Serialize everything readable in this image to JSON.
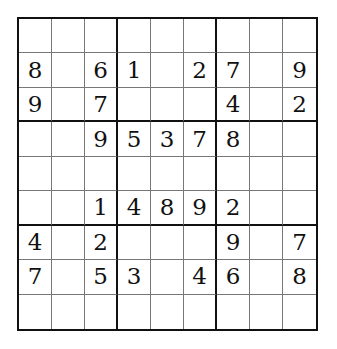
{
  "puzzle": {
    "size": 9,
    "box_size": 3,
    "grid": [
      [
        "",
        "",
        "",
        "",
        "",
        "",
        "",
        "",
        ""
      ],
      [
        "8",
        "",
        "6",
        "1",
        "",
        "2",
        "7",
        "",
        "9"
      ],
      [
        "9",
        "",
        "7",
        "",
        "",
        "",
        "4",
        "",
        "2"
      ],
      [
        "",
        "",
        "9",
        "5",
        "3",
        "7",
        "8",
        "",
        ""
      ],
      [
        "",
        "",
        "",
        "",
        "",
        "",
        "",
        "",
        ""
      ],
      [
        "",
        "",
        "1",
        "4",
        "8",
        "9",
        "2",
        "",
        ""
      ],
      [
        "4",
        "",
        "2",
        "",
        "",
        "",
        "9",
        "",
        "7"
      ],
      [
        "7",
        "",
        "5",
        "3",
        "",
        "4",
        "6",
        "",
        "8"
      ],
      [
        "",
        "",
        "",
        "",
        "",
        "",
        "",
        "",
        ""
      ]
    ]
  },
  "colors": {
    "grid_line": "#111111",
    "thin_line": "#777777",
    "digit": "#111111",
    "background": "#ffffff"
  }
}
